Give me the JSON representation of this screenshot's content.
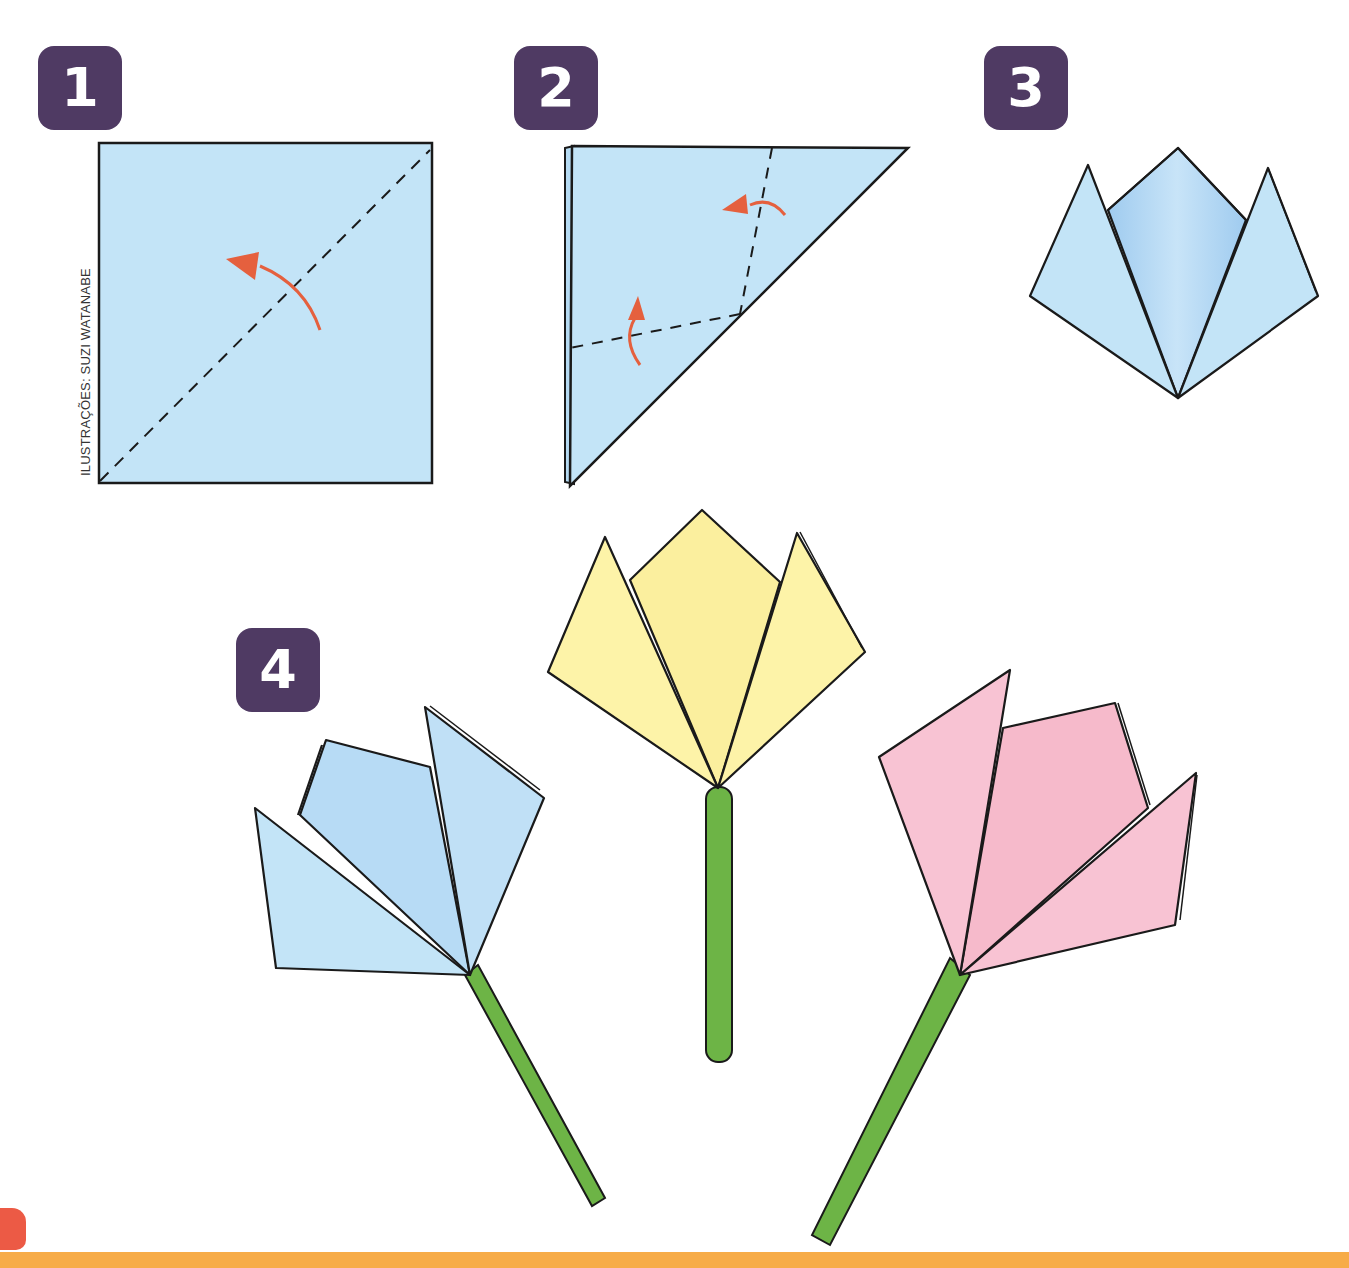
{
  "page": {
    "type": "origami-tulip-instructions",
    "credit": "ILUSTRAÇÕES: SUZI WATANABE"
  },
  "steps": [
    {
      "number": "1",
      "description": "square paper with diagonal dashed fold line and arrow folding bottom-right corner up to top-left"
    },
    {
      "number": "2",
      "description": "triangle with two dashed fold lines and two arrows folding corners up"
    },
    {
      "number": "3",
      "description": "folded blue tulip head with three points"
    },
    {
      "number": "4",
      "description": "three finished tulips with green stems"
    }
  ],
  "tulips": [
    {
      "color_name": "blue",
      "fill": "#bfe0f6",
      "shade": "#9fcbef"
    },
    {
      "color_name": "yellow",
      "fill": "#fdf3a8",
      "shade": "#f5e88a"
    },
    {
      "color_name": "pink",
      "fill": "#f8c3d3",
      "shade": "#f2a9c0"
    }
  ],
  "colors": {
    "badge": "#4f3a63",
    "paper_blue": "#c3e4f7",
    "arrow": "#e5603e",
    "stem": "#6db446",
    "footer": "#f7ac48",
    "outline": "#1a1a1a"
  }
}
